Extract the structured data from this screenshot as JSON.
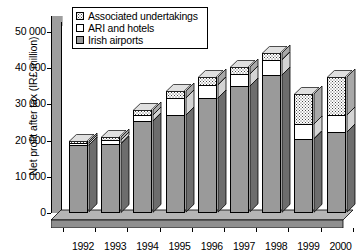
{
  "chart_data": {
    "type": "bar",
    "subtype": "stacked-3d-column",
    "title": "",
    "xlabel": "",
    "ylabel": "Net profit after tax (IR£ million)",
    "categories": [
      "1992",
      "1993",
      "1994",
      "1995",
      "1996",
      "1997",
      "1998",
      "1999",
      "2000"
    ],
    "series": [
      {
        "name": "Irish airports",
        "color": "#9a9a9a",
        "fill": "gray",
        "values": [
          18700,
          19200,
          25500,
          27100,
          31800,
          35000,
          38200,
          20500,
          22400
        ]
      },
      {
        "name": "ARI and hotels",
        "color": "#ffffff",
        "fill": "white",
        "values": [
          700,
          900,
          1600,
          4700,
          3700,
          3400,
          4200,
          4000,
          4700
        ]
      },
      {
        "name": "Associated undertakings",
        "color": "#ffffff",
        "fill": "dotted",
        "values": [
          600,
          900,
          1400,
          1900,
          2100,
          1900,
          1800,
          8400,
          10500
        ]
      }
    ],
    "totals": [
      20000,
      21000,
      28500,
      33700,
      37600,
      40300,
      44200,
      32900,
      37600
    ],
    "ylim": [
      0,
      52000
    ],
    "yticks": [
      0,
      10000,
      20000,
      30000,
      40000,
      50000
    ],
    "ytick_labels": [
      "0",
      "10 000",
      "20 000",
      "30 000",
      "40 000",
      "50 000"
    ],
    "grid": false,
    "legend_position": "top-left"
  },
  "legend": {
    "items": [
      {
        "label": "Associated undertakings",
        "fill": "dotted"
      },
      {
        "label": "ARI and hotels",
        "fill": "white"
      },
      {
        "label": "Irish airports",
        "fill": "gray"
      }
    ]
  }
}
